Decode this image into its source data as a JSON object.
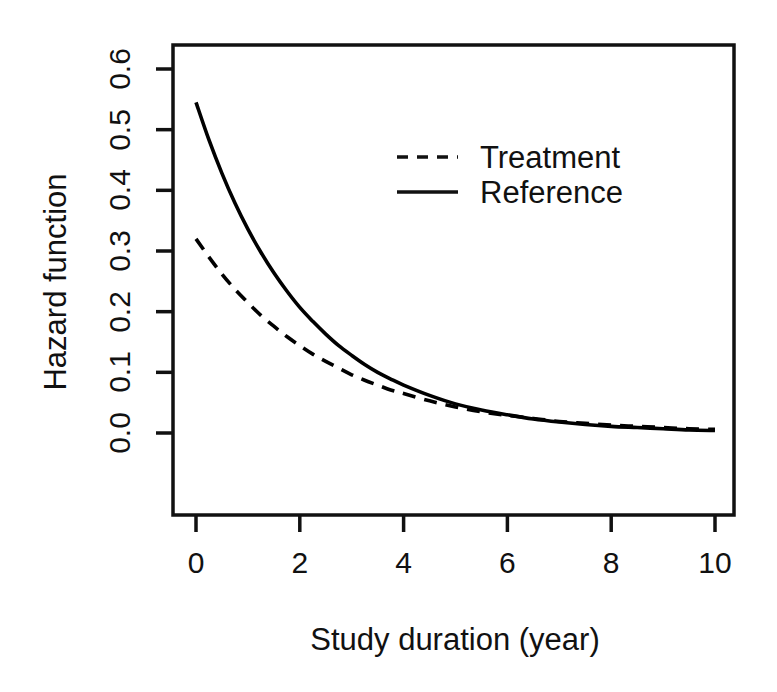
{
  "chart_data": {
    "type": "line",
    "title": "",
    "subtitle": "",
    "xlabel": "Study duration (year)",
    "ylabel": "Hazard function",
    "xlim": [
      0,
      10
    ],
    "ylim": [
      0.0,
      0.62
    ],
    "xticks": [
      0,
      2,
      4,
      6,
      8,
      10
    ],
    "xtick_labels": [
      "0",
      "2",
      "4",
      "6",
      "8",
      "10"
    ],
    "yticks": [
      0.0,
      0.1,
      0.2,
      0.3,
      0.4,
      0.5,
      0.6
    ],
    "ytick_labels": [
      "0.0",
      "0.1",
      "0.2",
      "0.3",
      "0.4",
      "0.5",
      "0.6"
    ],
    "grid": false,
    "box": true,
    "legend_position": "top-center-right",
    "line_color": "#000000",
    "background_color": "#ffffff",
    "x": [
      0,
      0.25,
      0.5,
      0.75,
      1,
      1.25,
      1.5,
      1.75,
      2,
      2.25,
      2.5,
      2.75,
      3,
      3.25,
      3.5,
      3.75,
      4,
      4.5,
      5,
      5.5,
      6,
      6.5,
      7,
      7.5,
      8,
      8.5,
      9,
      9.5,
      10
    ],
    "series": [
      {
        "name": "Treatment",
        "style": "dashed",
        "color": "#000000",
        "model": "0.32 * exp(-0.40 * t)",
        "values": [
          0.32,
          0.29,
          0.262,
          0.237,
          0.215,
          0.194,
          0.176,
          0.159,
          0.144,
          0.13,
          0.118,
          0.107,
          0.096,
          0.087,
          0.079,
          0.071,
          0.065,
          0.053,
          0.043,
          0.035,
          0.029,
          0.024,
          0.019,
          0.016,
          0.013,
          0.011,
          0.009,
          0.007,
          0.006
        ]
      },
      {
        "name": "Reference",
        "style": "solid",
        "color": "#000000",
        "model": "0.545 * exp(-0.485 * t)",
        "values": [
          0.545,
          0.483,
          0.428,
          0.379,
          0.336,
          0.298,
          0.264,
          0.234,
          0.207,
          0.184,
          0.163,
          0.144,
          0.128,
          0.113,
          0.1,
          0.089,
          0.079,
          0.062,
          0.048,
          0.038,
          0.03,
          0.023,
          0.018,
          0.014,
          0.011,
          0.009,
          0.007,
          0.005,
          0.004
        ]
      }
    ],
    "annotations": [
      {
        "text": "curves cross near t = 3.2",
        "x": 3.2,
        "y": 0.09
      }
    ]
  },
  "legend": {
    "entries": [
      {
        "label": "Treatment",
        "style": "dashed"
      },
      {
        "label": "Reference",
        "style": "solid"
      }
    ]
  }
}
